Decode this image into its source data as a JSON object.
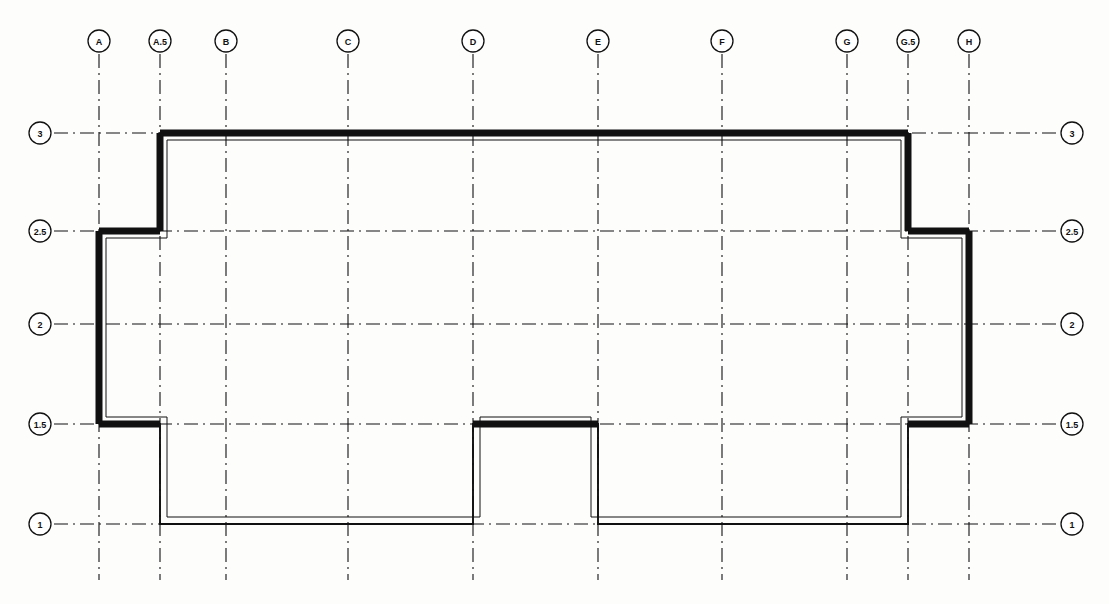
{
  "drawing": {
    "title": "Structural Grid Floor Plan",
    "drawing_type": "architectural-floor-plan",
    "background_color": "#fdfdfc",
    "line_color": "#111111",
    "wall_color": "#111111",
    "gridline_style": "dash-dot",
    "canvas": {
      "width": 1109,
      "height": 604
    }
  },
  "grid": {
    "columns": [
      {
        "label": "A",
        "x": 99
      },
      {
        "label": "A.5",
        "x": 160
      },
      {
        "label": "B",
        "x": 226
      },
      {
        "label": "C",
        "x": 348
      },
      {
        "label": "D",
        "x": 473
      },
      {
        "label": "E",
        "x": 598
      },
      {
        "label": "F",
        "x": 722
      },
      {
        "label": "G",
        "x": 847
      },
      {
        "label": "G.5",
        "x": 908
      },
      {
        "label": "H",
        "x": 969
      }
    ],
    "rows": [
      {
        "label": "3",
        "y": 133
      },
      {
        "label": "2.5",
        "y": 231
      },
      {
        "label": "2",
        "y": 324
      },
      {
        "label": "1.5",
        "y": 424
      },
      {
        "label": "1",
        "y": 524
      }
    ],
    "column_bubble_y": 41,
    "column_line_top": 54,
    "column_line_bottom": 580,
    "row_bubble_left_x": 40,
    "row_bubble_right_x": 1072,
    "row_line_left": 54,
    "row_line_right": 1058,
    "bubble_radius": 11,
    "bubble_font_size": 9
  },
  "building": {
    "name": "building-outline",
    "description": "Closed wall polygon with step notches at lower left, lower middle and both upper corners",
    "outer_vertices": [
      [
        160,
        133
      ],
      [
        908,
        133
      ],
      [
        908,
        231
      ],
      [
        969,
        231
      ],
      [
        969,
        424
      ],
      [
        908,
        424
      ],
      [
        908,
        524
      ],
      [
        598,
        524
      ],
      [
        598,
        424
      ],
      [
        473,
        424
      ],
      [
        473,
        524
      ],
      [
        160,
        524
      ],
      [
        160,
        424
      ],
      [
        99,
        424
      ],
      [
        99,
        231
      ],
      [
        160,
        231
      ]
    ],
    "wall_thickness": 7,
    "inner_offset": 7,
    "heavy_segments": [
      {
        "name": "north-wall",
        "x1": 160,
        "y1": 133,
        "x2": 908,
        "y2": 133
      },
      {
        "name": "west-wall",
        "x1": 99,
        "y1": 231,
        "x2": 99,
        "y2": 424
      },
      {
        "name": "northwest-return-wall",
        "x1": 99,
        "y1": 231,
        "x2": 160,
        "y2": 231
      },
      {
        "name": "northwest-jamb-wall",
        "x1": 160,
        "y1": 133,
        "x2": 160,
        "y2": 231
      },
      {
        "name": "southwest-return-wall",
        "x1": 99,
        "y1": 424,
        "x2": 160,
        "y2": 424
      },
      {
        "name": "northeast-jamb-wall",
        "x1": 908,
        "y1": 133,
        "x2": 908,
        "y2": 231
      },
      {
        "name": "northeast-return-wall",
        "x1": 908,
        "y1": 231,
        "x2": 969,
        "y2": 231
      },
      {
        "name": "east-wall",
        "x1": 969,
        "y1": 231,
        "x2": 969,
        "y2": 424
      },
      {
        "name": "southeast-return-wall",
        "x1": 908,
        "y1": 424,
        "x2": 969,
        "y2": 424
      },
      {
        "name": "center-notch-head",
        "x1": 473,
        "y1": 424,
        "x2": 598,
        "y2": 424
      }
    ],
    "light_segments": [
      {
        "name": "southwest-jamb-wall",
        "x1": 160,
        "y1": 424,
        "x2": 160,
        "y2": 524
      },
      {
        "name": "south-wall-west-bay",
        "x1": 160,
        "y1": 524,
        "x2": 473,
        "y2": 524
      },
      {
        "name": "center-notch-west-jamb",
        "x1": 473,
        "y1": 424,
        "x2": 473,
        "y2": 524
      },
      {
        "name": "center-notch-east-jamb",
        "x1": 598,
        "y1": 424,
        "x2": 598,
        "y2": 524
      },
      {
        "name": "south-wall-east-bay",
        "x1": 598,
        "y1": 524,
        "x2": 908,
        "y2": 524
      },
      {
        "name": "southeast-jamb-wall",
        "x1": 908,
        "y1": 424,
        "x2": 908,
        "y2": 524
      }
    ]
  }
}
